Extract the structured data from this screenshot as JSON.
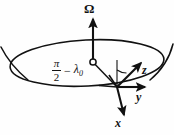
{
  "figure": {
    "background_color": "#fefefe",
    "stroke_color": "#111111",
    "labels": {
      "omega": "Ω",
      "axis_z": "z",
      "axis_y": "y",
      "axis_x": "x",
      "angle_numerator": "π",
      "angle_denominator": "2",
      "angle_operator": "−",
      "angle_lambda": "λ",
      "angle_lambda_subscript": "0",
      "angle_full": "π/2 − λ₀"
    },
    "elements": {
      "rotation_axis_arrow": "vertical-arrow-up",
      "center_marker": "open-circle",
      "equator_ellipse": "ellipse",
      "sphere_arc_left": "arc",
      "sphere_arc_right": "arc",
      "radius_line": "line-center-to-surface-point",
      "vertical_reference_line": "line",
      "angle_arc": "arc",
      "local_frame": [
        "x-axis-arrow",
        "y-axis-arrow",
        "z-axis-arrow"
      ]
    }
  }
}
